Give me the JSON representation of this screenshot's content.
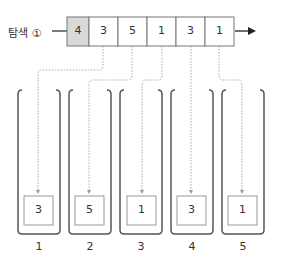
{
  "search_label": "탐색 ①",
  "array": {
    "cells": [
      {
        "value": "4",
        "highlighted": true
      },
      {
        "value": "3",
        "highlighted": false
      },
      {
        "value": "5",
        "highlighted": false
      },
      {
        "value": "1",
        "highlighted": false
      },
      {
        "value": "3",
        "highlighted": false
      },
      {
        "value": "1",
        "highlighted": false
      }
    ]
  },
  "buckets": [
    {
      "index_label": "1",
      "value": "3"
    },
    {
      "index_label": "2",
      "value": "5"
    },
    {
      "index_label": "3",
      "value": "1"
    },
    {
      "index_label": "4",
      "value": "3"
    },
    {
      "index_label": "5",
      "value": "1"
    }
  ],
  "colors": {
    "highlight": "#d9d9d9",
    "line": "#555555",
    "dash": "#aaaaaa",
    "box_border": "#999999"
  }
}
